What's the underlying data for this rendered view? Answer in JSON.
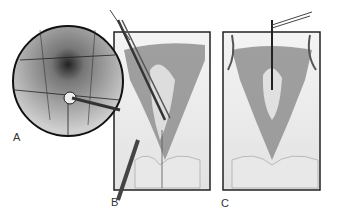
{
  "figure": {
    "panels": [
      {
        "label": "A",
        "description": "circular magnified view with instrument"
      },
      {
        "label": "B",
        "description": "surgical field with clamp and instrument"
      },
      {
        "label": "C",
        "description": "surgical field with suspended tissue"
      }
    ]
  }
}
